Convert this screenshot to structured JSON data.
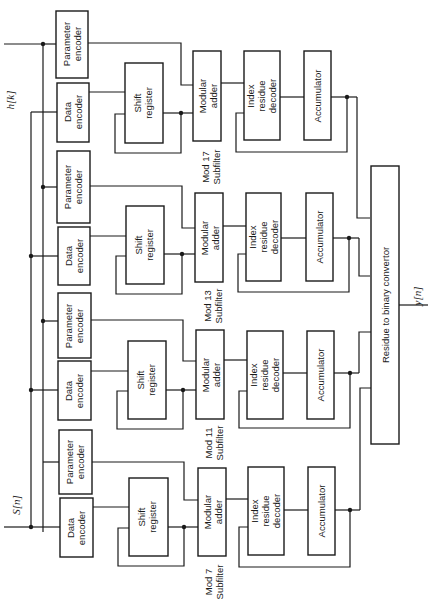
{
  "diagram": {
    "orientation": "rotated 90° counter-clockwise (text reads bottom-to-top)",
    "inputs": {
      "signal": "S[n]",
      "coefficients": "h[k]"
    },
    "output": "y[n]",
    "subfilters": [
      {
        "label_line1": "Mod 17",
        "label_line2": "Subfilter",
        "parameter_encoder": [
          "Parameter",
          "encoder"
        ],
        "data_encoder": [
          "Data",
          "encoder"
        ],
        "shift_register": [
          "Shift",
          "register"
        ],
        "modular_adder": [
          "Modular",
          "adder"
        ],
        "index_residue_decoder": [
          "Index",
          "residue",
          "decoder"
        ],
        "accumulator": "Accumulator"
      },
      {
        "label_line1": "Mod 13",
        "label_line2": "Subfilter",
        "parameter_encoder": [
          "Parameter",
          "encoder"
        ],
        "data_encoder": [
          "Data",
          "encoder"
        ],
        "shift_register": [
          "Shift",
          "register"
        ],
        "modular_adder": [
          "Modular",
          "adder"
        ],
        "index_residue_decoder": [
          "Index",
          "residue",
          "decoder"
        ],
        "accumulator": "Accumulator"
      },
      {
        "label_line1": "Mod 11",
        "label_line2": "Subfilter",
        "parameter_encoder": [
          "Parameter",
          "encoder"
        ],
        "data_encoder": [
          "Data",
          "encoder"
        ],
        "shift_register": [
          "Shift",
          "register"
        ],
        "modular_adder": [
          "Modular",
          "adder"
        ],
        "index_residue_decoder": [
          "Index",
          "residue",
          "decoder"
        ],
        "accumulator": "Accumulator"
      },
      {
        "label_line1": "Mod 7",
        "label_line2": "Subfilter",
        "parameter_encoder": [
          "Parameter",
          "encoder"
        ],
        "data_encoder": [
          "Data",
          "encoder"
        ],
        "shift_register": [
          "Shift",
          "register"
        ],
        "modular_adder": [
          "Modular",
          "adder"
        ],
        "index_residue_decoder": [
          "Index",
          "residue",
          "decoder"
        ],
        "accumulator": "Accumulator"
      }
    ],
    "convertor": "Residue to binary convertor"
  }
}
